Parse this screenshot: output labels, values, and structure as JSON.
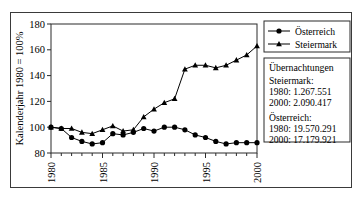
{
  "chart_data": {
    "type": "line",
    "title": "",
    "xlabel": "",
    "ylabel": "Kalenderjahr 1980 = 100%",
    "xlim": [
      1980,
      2000
    ],
    "ylim": [
      80,
      180
    ],
    "yticks": [
      80,
      100,
      120,
      140,
      160,
      180
    ],
    "xticks": [
      1980,
      1985,
      1990,
      1995,
      2000
    ],
    "xtick_labels": [
      "1980",
      "1985",
      "1990",
      "1995",
      "2000"
    ],
    "grid": "horizontal-dashed",
    "legend_position": "right-top",
    "x": [
      1980,
      1981,
      1982,
      1983,
      1984,
      1985,
      1986,
      1987,
      1988,
      1989,
      1990,
      1991,
      1992,
      1993,
      1994,
      1995,
      1996,
      1997,
      1998,
      1999,
      2000
    ],
    "series": [
      {
        "name": "Österreich",
        "marker": "circle",
        "color": "#000000",
        "values": [
          100,
          99,
          92,
          89,
          87,
          88,
          95,
          94,
          96,
          99,
          97,
          100,
          100,
          98,
          94,
          92,
          89,
          87,
          88,
          88,
          88
        ]
      },
      {
        "name": "Steiermark",
        "marker": "triangle",
        "color": "#000000",
        "values": [
          100,
          99,
          99,
          96,
          95,
          98,
          101,
          97,
          98,
          108,
          114,
          119,
          122,
          145,
          148,
          148,
          146,
          148,
          152,
          156,
          163
        ]
      }
    ]
  },
  "legend": {
    "entries": [
      {
        "label": "Österreich",
        "marker": "circle"
      },
      {
        "label": "Steiermark",
        "marker": "triangle"
      }
    ]
  },
  "info_box": {
    "heading": "Übernachtungen",
    "groups": [
      {
        "name": "Steiermark:",
        "lines": [
          "1980: 1.267.551",
          "2000: 2.090.417"
        ]
      },
      {
        "name": "Österreich:",
        "lines": [
          "1980: 19.570.291",
          "2000: 17.179.921"
        ]
      }
    ]
  },
  "colors": {
    "line": "#000000",
    "axis": "#2b2b2b",
    "grid": "#9a9a9a",
    "border": "#3a3a3a",
    "background": "#ffffff"
  }
}
